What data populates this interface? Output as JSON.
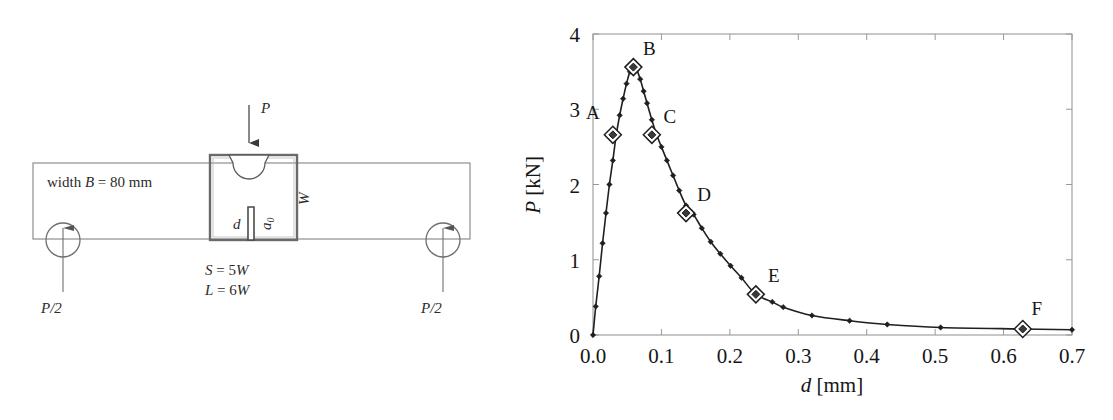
{
  "figure": {
    "background": "#ffffff",
    "ink": "#2b2b2b"
  },
  "beam_diagram": {
    "name": "three-point-bend-notched-beam",
    "width_label": "width B = 80 mm",
    "width_label_parts": {
      "prefix": "width ",
      "symbol": "B",
      "value": " = 80 mm"
    },
    "load_label": "P",
    "depth_label": "W",
    "notch_depth_label": "d",
    "notch_label": "a",
    "notch_label_sub": "0",
    "span_label_1": "S = 5W",
    "span_label_1_parts": {
      "symbol": "S",
      "value": " = 5",
      "unit": "W"
    },
    "span_label_2": "L = 6W",
    "span_label_2_parts": {
      "symbol": "L",
      "value": " = 6",
      "unit": "W"
    },
    "reaction_left": "P/2",
    "reaction_right": "P/2"
  },
  "chart_data": {
    "type": "line",
    "title": "",
    "xlabel": "d [mm]",
    "xlabel_symbol": "d",
    "xlabel_unit": " [mm]",
    "ylabel": "P [kN]",
    "ylabel_symbol": "P",
    "ylabel_unit": " [kN]",
    "xlim": [
      0.0,
      0.7
    ],
    "ylim": [
      0,
      4
    ],
    "grid": false,
    "legend": "none",
    "xticks": [
      0.0,
      0.1,
      0.2,
      0.3,
      0.4,
      0.5,
      0.6,
      0.7
    ],
    "xtick_labels": [
      "0.0",
      "0.1",
      "0.2",
      "0.3",
      "0.4",
      "0.5",
      "0.6",
      "0.7"
    ],
    "yticks": [
      0,
      1,
      2,
      3,
      4
    ],
    "ytick_labels": [
      "0",
      "1",
      "2",
      "3",
      "4"
    ],
    "series": [
      {
        "name": "load-displacement",
        "marker": "small-diamond",
        "x": [
          0.0,
          0.004,
          0.009,
          0.014,
          0.019,
          0.024,
          0.029,
          0.034,
          0.039,
          0.044,
          0.049,
          0.054,
          0.059,
          0.064,
          0.069,
          0.074,
          0.079,
          0.086,
          0.093,
          0.1,
          0.108,
          0.117,
          0.126,
          0.136,
          0.147,
          0.159,
          0.172,
          0.186,
          0.201,
          0.217,
          0.238,
          0.262,
          0.278,
          0.32,
          0.375,
          0.43,
          0.508,
          0.628,
          0.7
        ],
        "y": [
          0.0,
          0.38,
          0.78,
          1.22,
          1.62,
          2.0,
          2.32,
          2.66,
          2.92,
          3.14,
          3.34,
          3.5,
          3.56,
          3.52,
          3.4,
          3.24,
          3.08,
          2.86,
          2.66,
          2.5,
          2.32,
          2.12,
          1.92,
          1.72,
          1.6,
          1.42,
          1.24,
          1.08,
          0.92,
          0.76,
          0.54,
          0.44,
          0.37,
          0.26,
          0.19,
          0.14,
          0.1,
          0.08,
          0.07
        ]
      }
    ],
    "annotated_points": [
      {
        "label": "A",
        "x": 0.029,
        "y": 2.66,
        "label_dx": -20,
        "label_dy": -16
      },
      {
        "label": "B",
        "x": 0.059,
        "y": 3.56,
        "label_dx": 16,
        "label_dy": -12
      },
      {
        "label": "C",
        "x": 0.086,
        "y": 2.66,
        "label_dx": 18,
        "label_dy": -12
      },
      {
        "label": "D",
        "x": 0.136,
        "y": 1.62,
        "label_dx": 18,
        "label_dy": -12
      },
      {
        "label": "E",
        "x": 0.238,
        "y": 0.54,
        "label_dx": 18,
        "label_dy": -12
      },
      {
        "label": "F",
        "x": 0.628,
        "y": 0.08,
        "label_dx": 14,
        "label_dy": -14
      }
    ]
  }
}
